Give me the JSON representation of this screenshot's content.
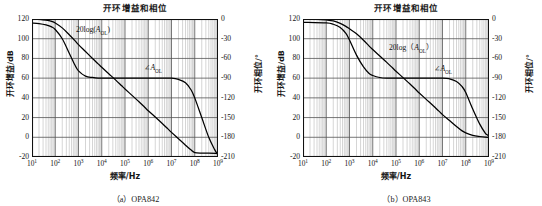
{
  "figures": [
    {
      "id": "opa842",
      "title": "开环增益和相位",
      "caption": "（a）OPA842",
      "gain_label": "20log(",
      "gain_label_sym": "A",
      "gain_label_sub": "OL",
      "gain_label_tail": ")",
      "phase_label_sym": "A",
      "phase_label_sub": "OL",
      "chart_data": {
        "type": "line",
        "title": "开环增益和相位",
        "xlabel": "频率/Hz",
        "ylabel": "开环增益/dB",
        "y2label": "开环相位/°",
        "xscale": "log",
        "xlim": [
          10,
          1000000000
        ],
        "ylim": [
          -20,
          120
        ],
        "y2lim": [
          -210,
          0
        ],
        "xticks": [
          "10^1",
          "10^2",
          "10^3",
          "10^4",
          "10^5",
          "10^6",
          "10^7",
          "10^8",
          "10^9"
        ],
        "yticks": [
          120,
          100,
          80,
          60,
          40,
          20,
          0,
          -20
        ],
        "y2ticks": [
          0,
          -30,
          -60,
          -90,
          -120,
          -150,
          -180,
          -210
        ],
        "grid": true,
        "legend": "inline-annotations",
        "series": [
          {
            "name": "20log(A_OL)",
            "unit": "dB",
            "axis": "left",
            "points": [
              [
                10,
                120
              ],
              [
                20,
                119.6
              ],
              [
                40,
                118.8
              ],
              [
                70,
                117.5
              ],
              [
                100,
                116.0
              ],
              [
                200,
                111.0
              ],
              [
                400,
                104.0
              ],
              [
                700,
                98.0
              ],
              [
                1000,
                94.0
              ],
              [
                2000,
                87.0
              ],
              [
                4000,
                80.0
              ],
              [
                7000,
                74.5
              ],
              [
                10000,
                71.0
              ],
              [
                20000,
                64.5
              ],
              [
                40000,
                58.0
              ],
              [
                70000,
                52.5
              ],
              [
                100000,
                49.0
              ],
              [
                200000,
                42.5
              ],
              [
                400000,
                36.0
              ],
              [
                700000,
                30.5
              ],
              [
                1000000,
                27.0
              ],
              [
                2000000,
                20.5
              ],
              [
                4000000,
                14.0
              ],
              [
                7000000,
                8.5
              ],
              [
                10000000,
                5.0
              ],
              [
                20000000,
                -1.5
              ],
              [
                40000000,
                -8.0
              ],
              [
                70000000,
                -13.0
              ],
              [
                100000000,
                -15.5
              ],
              [
                200000000,
                -16.0
              ],
              [
                400000000,
                -16.0
              ],
              [
                1000000000,
                -16.5
              ]
            ]
          },
          {
            "name": "∠A_OL",
            "unit": "degrees",
            "axis": "right",
            "points": [
              [
                10,
                -6
              ],
              [
                20,
                -7
              ],
              [
                40,
                -9
              ],
              [
                70,
                -12
              ],
              [
                100,
                -16
              ],
              [
                200,
                -30
              ],
              [
                400,
                -52
              ],
              [
                700,
                -70
              ],
              [
                1000,
                -79
              ],
              [
                2000,
                -87
              ],
              [
                4000,
                -89
              ],
              [
                7000,
                -90
              ],
              [
                10000,
                -90
              ],
              [
                100000,
                -90
              ],
              [
                1000000,
                -90
              ],
              [
                5000000,
                -90
              ],
              [
                10000000,
                -90
              ],
              [
                20000000,
                -92
              ],
              [
                40000000,
                -97
              ],
              [
                70000000,
                -108
              ],
              [
                100000000,
                -120
              ],
              [
                200000000,
                -150
              ],
              [
                400000000,
                -180
              ],
              [
                700000000,
                -198
              ],
              [
                1000000000,
                -207
              ]
            ]
          }
        ]
      }
    },
    {
      "id": "opa843",
      "title": "开环增益和相位",
      "caption": "（b）OPA843",
      "gain_label": "20log（",
      "gain_label_sym": "A",
      "gain_label_sub": "OL",
      "gain_label_tail": "）",
      "phase_label_sym": "A",
      "phase_label_sub": "OL",
      "chart_data": {
        "type": "line",
        "title": "开环增益和相位",
        "xlabel": "频率/Hz",
        "ylabel": "开环增益/dB",
        "y2label": "开环相位/°",
        "xscale": "log",
        "xlim": [
          10,
          1000000000
        ],
        "ylim": [
          -20,
          120
        ],
        "y2lim": [
          -210,
          0
        ],
        "xticks": [
          "10^1",
          "10^2",
          "10^3",
          "10^4",
          "10^5",
          "10^6",
          "10^7",
          "10^8",
          "10^9"
        ],
        "yticks": [
          120,
          100,
          80,
          60,
          40,
          20,
          0,
          -20
        ],
        "y2ticks": [
          0,
          -30,
          -60,
          -90,
          -120,
          -150,
          -180,
          -210
        ],
        "grid": true,
        "legend": "inline-annotations",
        "series": [
          {
            "name": "20log(A_OL)",
            "unit": "dB",
            "axis": "left",
            "points": [
              [
                10,
                120
              ],
              [
                40,
                119.7
              ],
              [
                100,
                119.0
              ],
              [
                200,
                118.0
              ],
              [
                400,
                115.5
              ],
              [
                700,
                112.5
              ],
              [
                1000,
                110.0
              ],
              [
                2000,
                105.0
              ],
              [
                4000,
                98.5
              ],
              [
                7000,
                92.5
              ],
              [
                10000,
                89.0
              ],
              [
                20000,
                82.5
              ],
              [
                40000,
                76.0
              ],
              [
                70000,
                70.5
              ],
              [
                100000,
                67.0
              ],
              [
                200000,
                60.5
              ],
              [
                400000,
                54.0
              ],
              [
                700000,
                48.5
              ],
              [
                1000000,
                45.0
              ],
              [
                2000000,
                38.5
              ],
              [
                4000000,
                32.0
              ],
              [
                7000000,
                26.5
              ],
              [
                10000000,
                23.0
              ],
              [
                20000000,
                17.0
              ],
              [
                40000000,
                11.0
              ],
              [
                70000000,
                6.5
              ],
              [
                100000000,
                4.5
              ],
              [
                200000000,
                2.0
              ],
              [
                400000000,
                0.8
              ],
              [
                700000000,
                0.2
              ],
              [
                1000000000,
                0.0
              ]
            ]
          },
          {
            "name": "∠A_OL",
            "unit": "degrees",
            "axis": "right",
            "points": [
              [
                10,
                -5
              ],
              [
                100,
                -6
              ],
              [
                200,
                -8
              ],
              [
                400,
                -13
              ],
              [
                700,
                -22
              ],
              [
                1000,
                -32
              ],
              [
                2000,
                -55
              ],
              [
                4000,
                -73
              ],
              [
                7000,
                -83
              ],
              [
                10000,
                -86
              ],
              [
                20000,
                -89
              ],
              [
                40000,
                -90
              ],
              [
                100000,
                -90
              ],
              [
                1000000,
                -90
              ],
              [
                10000000,
                -90
              ],
              [
                20000000,
                -91
              ],
              [
                40000000,
                -95
              ],
              [
                70000000,
                -103
              ],
              [
                100000000,
                -112
              ],
              [
                200000000,
                -137
              ],
              [
                400000000,
                -160
              ],
              [
                700000000,
                -174
              ],
              [
                1000000000,
                -180
              ],
              [
                1100000000,
                -205
              ]
            ]
          }
        ]
      }
    }
  ]
}
